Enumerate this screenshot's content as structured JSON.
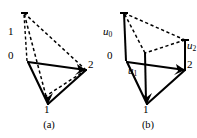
{
  "figure": {
    "background_color": "#ffffff",
    "ink_color": "#000000",
    "panels": [
      {
        "id": "a",
        "caption": "(a)",
        "vertex_labels": {
          "top_left": "1",
          "origin": "0",
          "right": "2",
          "bottom": "1"
        },
        "solid_triangle": {
          "points": "28,62 86,70 48,104",
          "description": "base triangle with vertices 0, 2, 1"
        },
        "dashed_triangle": {
          "points": "24,13 86,70 46,96",
          "description": "lifted triangle drawn with dashed edges"
        },
        "vertical_bars": [
          {
            "name": "bar-at-origin",
            "x1": 28,
            "y1": 62,
            "x2": 24,
            "y2": 13
          },
          {
            "name": "bar-at-bottom",
            "x1": 48,
            "y1": 104,
            "x2": 46,
            "y2": 96
          }
        ],
        "label_positions": {
          "top_left": {
            "x": 8,
            "y": 32
          },
          "origin": {
            "x": 8,
            "y": 55
          },
          "right": {
            "x": 88,
            "y": 63
          },
          "bottom": {
            "x": 44,
            "y": 106
          }
        }
      },
      {
        "id": "b",
        "caption": "(b)",
        "vertex_labels": {
          "origin": "0",
          "right": "2",
          "bottom": "1"
        },
        "function_labels": {
          "u0": "u",
          "u0_sub": "0",
          "u1": "u",
          "u1_sub": "1",
          "u2": "u",
          "u2_sub": "2"
        },
        "solid_triangle": {
          "points": "28,62 86,70 48,104",
          "description": "base triangle with vertices 0, 2, 1"
        },
        "dashed_triangle": {
          "points": "25,13 86,40 46,53",
          "description": "lifted triangle drawn with dashed edges"
        },
        "vertical_bars": [
          {
            "name": "bar-u0",
            "x1": 28,
            "y1": 62,
            "x2": 25,
            "y2": 13
          },
          {
            "name": "bar-u2",
            "x1": 86,
            "y1": 70,
            "x2": 86,
            "y2": 40
          },
          {
            "name": "bar-u1",
            "x1": 48,
            "y1": 104,
            "x2": 46,
            "y2": 53
          }
        ],
        "label_positions": {
          "origin": {
            "x": 8,
            "y": 55
          },
          "right": {
            "x": 88,
            "y": 63
          },
          "bottom": {
            "x": 44,
            "y": 106
          },
          "u0": {
            "x": 5,
            "y": 32
          },
          "u1": {
            "x": 30,
            "y": 70
          },
          "u2": {
            "x": 88,
            "y": 44
          }
        }
      }
    ]
  }
}
